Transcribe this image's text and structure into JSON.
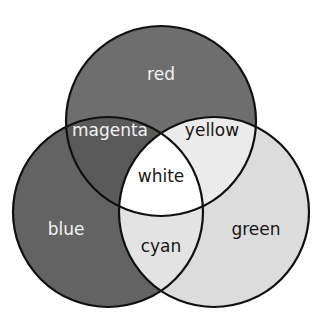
{
  "diagram": {
    "type": "venn-3-circle",
    "background_color": "#ffffff",
    "outline_color": "#101010",
    "outline_width": 2.2,
    "canvas": {
      "width": 322,
      "height": 321
    },
    "circles": [
      {
        "id": "red",
        "label": "red",
        "cx": 161,
        "cy": 121,
        "r": 95,
        "fill": "#6e6e6e"
      },
      {
        "id": "blue",
        "label": "blue",
        "cx": 108,
        "cy": 212,
        "r": 95,
        "fill": "#636363"
      },
      {
        "id": "green",
        "label": "green",
        "cx": 214,
        "cy": 212,
        "r": 95,
        "fill": "#dcdcdc"
      }
    ],
    "regions": [
      {
        "id": "red",
        "label": "red",
        "sets": [
          "red"
        ],
        "fill": "#6e6e6e",
        "text_color": "#f2f2f2",
        "label_x": 161,
        "label_y": 75,
        "label_tone": "light"
      },
      {
        "id": "blue",
        "label": "blue",
        "sets": [
          "blue"
        ],
        "fill": "#636363",
        "text_color": "#f2f2f2",
        "label_x": 66,
        "label_y": 230,
        "label_tone": "light"
      },
      {
        "id": "green",
        "label": "green",
        "sets": [
          "green"
        ],
        "fill": "#dcdcdc",
        "text_color": "#171717",
        "label_x": 256,
        "label_y": 230,
        "label_tone": "dark"
      },
      {
        "id": "magenta",
        "label": "magenta",
        "sets": [
          "red",
          "blue"
        ],
        "fill": "#5a5a5a",
        "text_color": "#f2f2f2",
        "label_x": 110,
        "label_y": 131,
        "label_tone": "light"
      },
      {
        "id": "yellow",
        "label": "yellow",
        "sets": [
          "red",
          "green"
        ],
        "fill": "#ebebeb",
        "text_color": "#171717",
        "label_x": 212,
        "label_y": 131,
        "label_tone": "dark"
      },
      {
        "id": "cyan",
        "label": "cyan",
        "sets": [
          "blue",
          "green"
        ],
        "fill": "#e3e3e3",
        "text_color": "#171717",
        "label_x": 161,
        "label_y": 247,
        "label_tone": "dark"
      },
      {
        "id": "white",
        "label": "white",
        "sets": [
          "red",
          "blue",
          "green"
        ],
        "fill": "#ffffff",
        "text_color": "#171717",
        "label_x": 161,
        "label_y": 177,
        "label_tone": "dark"
      }
    ]
  }
}
